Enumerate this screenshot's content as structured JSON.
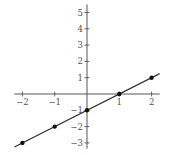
{
  "chart_data": {
    "type": "line",
    "title": "",
    "xlabel": "",
    "ylabel": "",
    "equation": "y = x - 1",
    "x": [
      -2,
      -1,
      0,
      1,
      2
    ],
    "y": [
      -3,
      -2,
      -1,
      0,
      1
    ],
    "series": [
      {
        "name": "y = x - 1",
        "points": [
          [
            -2,
            -3
          ],
          [
            -1,
            -2
          ],
          [
            0,
            -1
          ],
          [
            1,
            0
          ],
          [
            2,
            1
          ]
        ]
      }
    ],
    "xlim": [
      -2.25,
      2.25
    ],
    "ylim": [
      -3.35,
      5.5
    ],
    "x_ticks": [
      "-2",
      "-1",
      "1",
      "2"
    ],
    "y_ticks": [
      "5",
      "4",
      "3",
      "2",
      "1",
      "-1",
      "-2",
      "-3"
    ],
    "grid": false,
    "legend": "none",
    "colors": {
      "line": "#333333",
      "axis": "#444444",
      "point": "#111111"
    }
  }
}
